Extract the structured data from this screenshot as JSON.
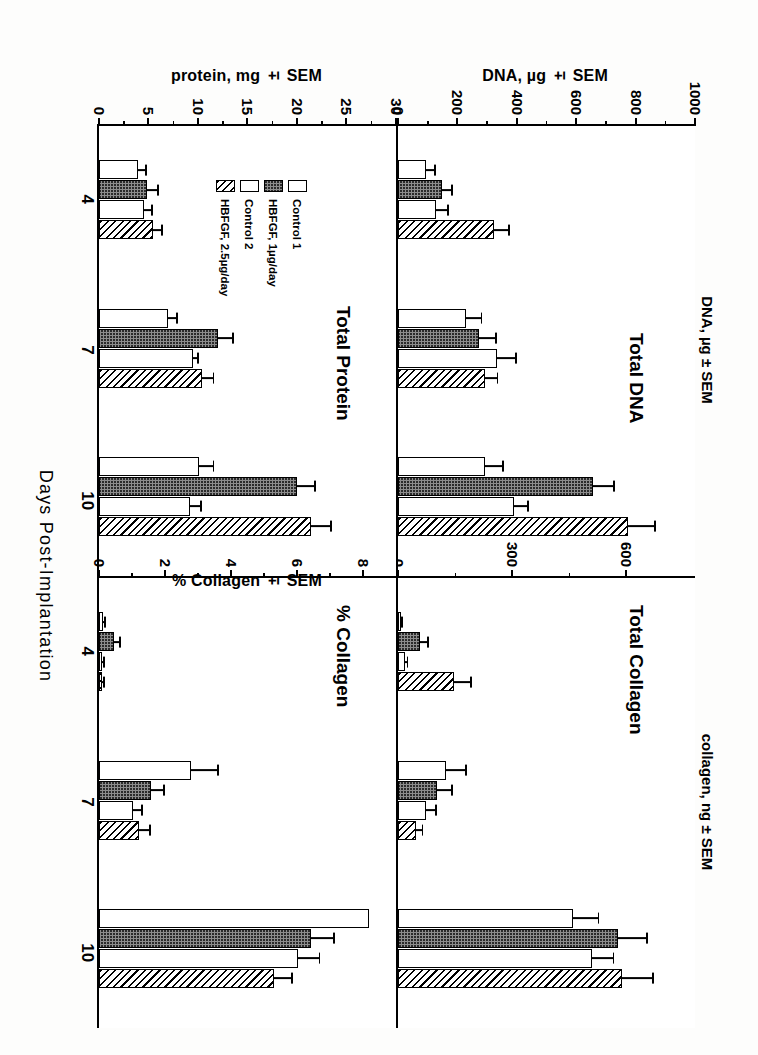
{
  "figure": {
    "xaxis_title": "Days Post-Implantation",
    "timepoints": [
      "4",
      "7",
      "10"
    ],
    "legend": [
      {
        "label": "Control 1",
        "fill": "white"
      },
      {
        "label": "HBFGF, 1µg/day",
        "fill": "dotted"
      },
      {
        "label": "Control 2",
        "fill": "white"
      },
      {
        "label": "HBFGF, 2.5µg/day",
        "fill": "hatched"
      }
    ]
  },
  "chart_data": [
    {
      "type": "bar",
      "panel_id": "total-dna",
      "title": "Total DNA",
      "ylabel": "DNA, µg ± SEM",
      "xlabel": "Days Post-Implantation",
      "categories": [
        "4",
        "7",
        "10"
      ],
      "ylim": [
        0,
        1000
      ],
      "yticks": [
        0,
        200,
        400,
        600,
        800,
        1000
      ],
      "ytick_labels": [
        "0",
        "200",
        "400",
        "600",
        "800",
        "1000"
      ],
      "grid": false,
      "legend_position": "none",
      "series": [
        {
          "name": "Control 1",
          "fill": "white",
          "values": [
            95,
            235,
            300
          ],
          "errors": [
            35,
            55,
            65
          ]
        },
        {
          "name": "HBFGF, 1µg/day",
          "fill": "dotted",
          "values": [
            150,
            280,
            670
          ],
          "errors": [
            40,
            60,
            75
          ]
        },
        {
          "name": "Control 2",
          "fill": "white",
          "values": [
            130,
            340,
            400
          ],
          "errors": [
            45,
            70,
            50
          ]
        },
        {
          "name": "HBFGF, 2.5µg/day",
          "fill": "hatched",
          "values": [
            330,
            300,
            790
          ],
          "errors": [
            55,
            45,
            95
          ]
        }
      ]
    },
    {
      "type": "bar",
      "panel_id": "total-collagen",
      "title": "Total Collagen",
      "ylabel": "collagen, ng ± SEM",
      "xlabel": "Days Post-Implantation",
      "categories": [
        "4",
        "7",
        "10"
      ],
      "ylim": [
        0,
        780
      ],
      "yticks": [
        0,
        300,
        600
      ],
      "ytick_labels": [
        "0",
        "300",
        "600"
      ],
      "grid": false,
      "legend_position": "none",
      "series": [
        {
          "name": "Control 1",
          "fill": "white",
          "values": [
            8,
            130,
            470
          ],
          "errors": [
            6,
            55,
            70
          ]
        },
        {
          "name": "HBFGF, 1µg/day",
          "fill": "dotted",
          "values": [
            60,
            105,
            590
          ],
          "errors": [
            22,
            42,
            80
          ]
        },
        {
          "name": "Control 2",
          "fill": "white",
          "values": [
            18,
            75,
            520
          ],
          "errors": [
            10,
            30,
            60
          ]
        },
        {
          "name": "HBFGF, 2.5µg/day",
          "fill": "hatched",
          "values": [
            150,
            48,
            600
          ],
          "errors": [
            48,
            20,
            85
          ]
        }
      ]
    },
    {
      "type": "bar",
      "panel_id": "total-protein",
      "title": "Total Protein",
      "ylabel": "protein, mg ± SEM",
      "xlabel": "Days Post-Implantation",
      "categories": [
        "4",
        "7",
        "10"
      ],
      "ylim": [
        0,
        30
      ],
      "yticks": [
        0,
        5,
        10,
        15,
        20,
        25,
        30
      ],
      "ytick_labels": [
        "0",
        "5",
        "10",
        "15",
        "20",
        "25",
        "30"
      ],
      "grid": false,
      "legend_position": "inside-left",
      "series": [
        {
          "name": "Control 1",
          "fill": "white",
          "values": [
            4.0,
            7.1,
            10.3
          ],
          "errors": [
            0.9,
            1.0,
            1.6
          ]
        },
        {
          "name": "HBFGF, 1µg/day",
          "fill": "dotted",
          "values": [
            5.0,
            12.3,
            20.4
          ],
          "errors": [
            1.2,
            1.6,
            2.0
          ]
        },
        {
          "name": "Control 2",
          "fill": "white",
          "values": [
            4.6,
            9.7,
            9.4
          ],
          "errors": [
            1.0,
            0.6,
            1.2
          ]
        },
        {
          "name": "HBFGF, 2.5µg/day",
          "fill": "hatched",
          "values": [
            5.6,
            10.6,
            21.9
          ],
          "errors": [
            1.0,
            1.3,
            2.1
          ]
        }
      ]
    },
    {
      "type": "bar",
      "panel_id": "percent-collagen",
      "title": "% Collagen",
      "ylabel": "% Collagen ± SEM",
      "xlabel": "Days Post-Implantation",
      "categories": [
        "4",
        "7",
        "10"
      ],
      "ylim": [
        0,
        9
      ],
      "yticks": [
        0,
        2,
        4,
        6,
        8
      ],
      "ytick_labels": [
        "0",
        "2",
        "4",
        "6",
        "8"
      ],
      "grid": false,
      "legend_position": "none",
      "series": [
        {
          "name": "Control 1",
          "fill": "white",
          "values": [
            0.12,
            2.85,
            8.35
          ],
          "errors": [
            0.1,
            0.85,
            0.0
          ]
        },
        {
          "name": "HBFGF, 1µg/day",
          "fill": "dotted",
          "values": [
            0.45,
            1.6,
            6.55
          ],
          "errors": [
            0.22,
            0.45,
            0.75
          ]
        },
        {
          "name": "Control 2",
          "fill": "white",
          "values": [
            0.1,
            1.05,
            6.15
          ],
          "errors": [
            0.08,
            0.3,
            0.7
          ]
        },
        {
          "name": "HBFGF, 2.5µg/day",
          "fill": "hatched",
          "values": [
            0.1,
            1.25,
            5.4
          ],
          "errors": [
            0.08,
            0.35,
            0.6
          ]
        }
      ]
    }
  ]
}
